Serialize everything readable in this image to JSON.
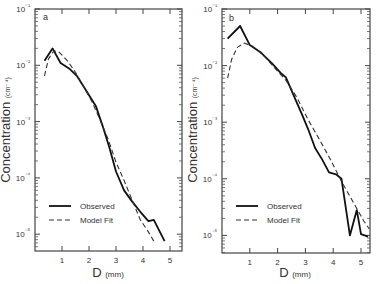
{
  "chart_data": [
    {
      "type": "line",
      "panel_label": "a",
      "title": "",
      "xlabel": "D",
      "xlabel_unit": "(mm)",
      "ylabel": "Concentration",
      "ylabel_unit": "(cm⁻⁴)",
      "yscale": "log",
      "xlim": [
        0,
        5.4
      ],
      "ylim": [
        5e-06,
        0.1
      ],
      "xticks": [
        "1",
        "2",
        "3",
        "4",
        "5"
      ],
      "yticks": [
        "10⁻¹",
        "10⁻²",
        "10⁻³",
        "10⁻⁴",
        "10⁻⁵"
      ],
      "legend": {
        "position": "lower left",
        "entries": [
          "Observed",
          "Model Fit"
        ]
      },
      "series": [
        {
          "name": "Observed",
          "style": "solid",
          "x": [
            0.35,
            0.65,
            0.95,
            1.3,
            1.55,
            1.8,
            2.05,
            2.25,
            2.5,
            2.75,
            3.0,
            3.3,
            3.6,
            3.9,
            4.2,
            4.4,
            4.8
          ],
          "y": [
            0.012,
            0.02,
            0.011,
            0.0085,
            0.0065,
            0.0042,
            0.0027,
            0.0019,
            0.00085,
            0.00035,
            0.00013,
            6e-05,
            3.8e-05,
            2.5e-05,
            1.7e-05,
            1.8e-05,
            7.5e-06
          ]
        },
        {
          "name": "Model Fit",
          "style": "dashed",
          "x": [
            0.35,
            0.5,
            0.7,
            0.9,
            1.2,
            1.5,
            1.8,
            2.1,
            2.4,
            2.7,
            3.0,
            3.3,
            3.6,
            3.9,
            4.2,
            4.4
          ],
          "y": [
            0.0065,
            0.013,
            0.018,
            0.017,
            0.012,
            0.0075,
            0.0042,
            0.0023,
            0.0011,
            0.0005,
            0.00019,
            9e-05,
            4e-05,
            1.8e-05,
            1.1e-05,
            7.5e-06
          ]
        }
      ]
    },
    {
      "type": "line",
      "panel_label": "b",
      "title": "",
      "xlabel": "D",
      "xlabel_unit": "(mm)",
      "ylabel": "Concentration",
      "ylabel_unit": "(cm⁻⁴)",
      "yscale": "log",
      "xlim": [
        0,
        5.3
      ],
      "ylim": [
        5e-06,
        0.1
      ],
      "xticks": [
        "1",
        "2",
        "3",
        "4",
        "5"
      ],
      "yticks": [
        "10⁻¹",
        "10⁻²",
        "10⁻³",
        "10⁻⁴",
        "10⁻⁵"
      ],
      "legend": {
        "position": "lower left",
        "entries": [
          "Observed",
          "Model Fit"
        ]
      },
      "series": [
        {
          "name": "Observed",
          "style": "solid",
          "x": [
            0.2,
            0.65,
            1.0,
            1.4,
            1.8,
            2.1,
            2.3,
            2.6,
            2.9,
            3.1,
            3.35,
            3.6,
            3.85,
            4.1,
            4.3,
            4.6,
            4.85,
            5.0,
            5.25
          ],
          "y": [
            0.03,
            0.05,
            0.023,
            0.017,
            0.011,
            0.0075,
            0.0062,
            0.0028,
            0.0013,
            0.00075,
            0.00035,
            0.00022,
            0.00013,
            0.00012,
            0.0001,
            1e-05,
            2.8e-05,
            1.05e-05,
            9.5e-06
          ]
        },
        {
          "name": "Model Fit",
          "style": "dashed",
          "x": [
            0.2,
            0.35,
            0.55,
            0.8,
            1.1,
            1.5,
            1.9,
            2.3,
            2.7,
            3.1,
            3.5,
            3.9,
            4.3,
            4.7,
            5.1,
            5.3
          ],
          "y": [
            0.006,
            0.013,
            0.021,
            0.025,
            0.022,
            0.015,
            0.009,
            0.0055,
            0.0027,
            0.0011,
            0.0005,
            0.00022,
            9e-05,
            4e-05,
            1.8e-05,
            1.3e-05
          ]
        }
      ]
    }
  ]
}
